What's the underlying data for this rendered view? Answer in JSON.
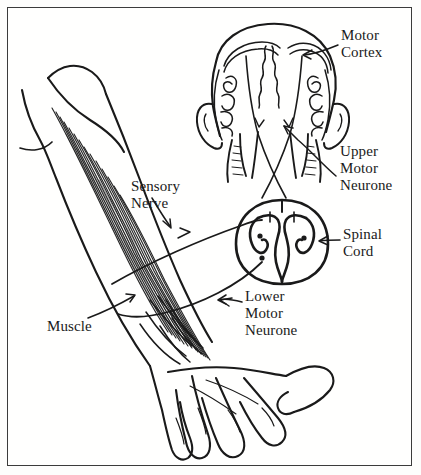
{
  "figure": {
    "style": "black-and-white line drawing",
    "background_color": "#fdfdfc",
    "ink_color": "#1a1a1a",
    "border_color": "#3b3b3b"
  },
  "labels": {
    "motor_cortex": "Motor\nCortex",
    "upper_motor_neurone": "Upper\nMotor\nNeurone",
    "spinal_cord": "Spinal\nCord",
    "sensory_nerve": "Sensory\nNerve",
    "lower_motor_neurone": "Lower\nMotor\nNeurone",
    "muscle": "Muscle"
  },
  "anatomy": {
    "parts": [
      "brain-coronal-section",
      "left-ear",
      "right-ear",
      "brainstem-decussation",
      "spinal-cord-cross-section",
      "forearm-muscles",
      "hand"
    ],
    "pathways": [
      "upper-motor-neurone-tract",
      "lower-motor-neurone",
      "sensory-nerve"
    ]
  }
}
